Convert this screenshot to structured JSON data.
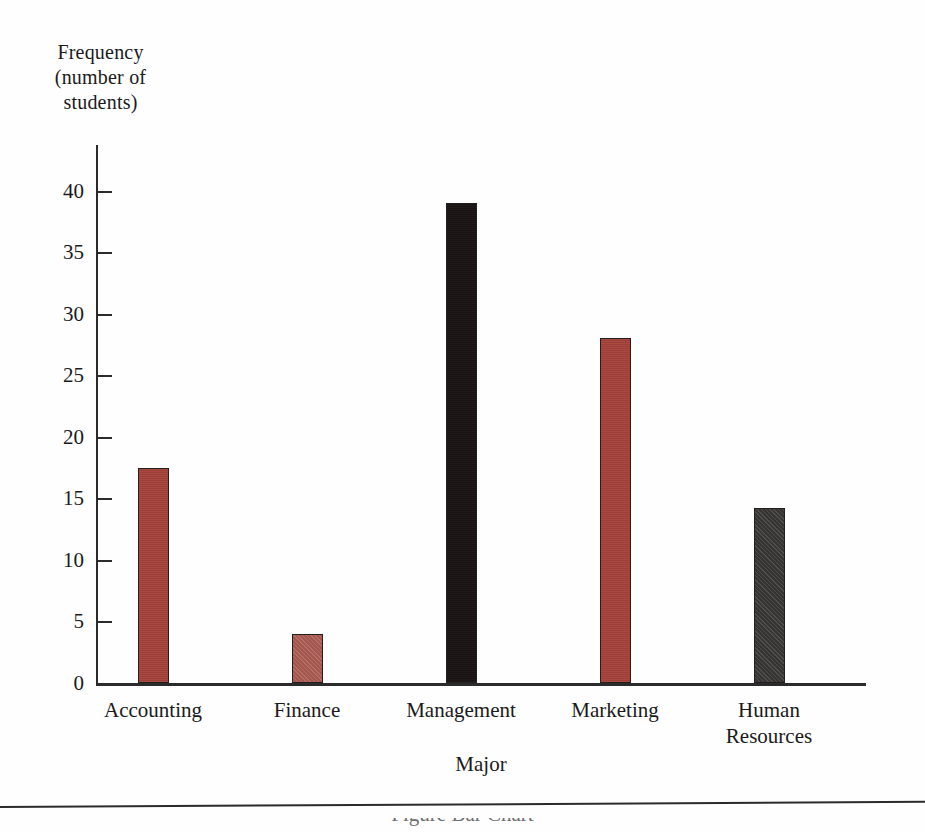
{
  "chart_data": {
    "type": "bar",
    "title": "",
    "xlabel": "Major",
    "ylabel": "Frequency\n(number of\nstudents)",
    "categories": [
      "Accounting",
      "Finance",
      "Management",
      "Marketing",
      "Human\nResources"
    ],
    "values": [
      17.5,
      4,
      39,
      28,
      14.2
    ],
    "bar_colors": [
      "#a4413a",
      "#ab5b51",
      "#191313",
      "#a4413a",
      "#3b3a38"
    ],
    "ylim": [
      0,
      43.7
    ],
    "yticks": [
      0,
      5,
      10,
      15,
      20,
      25,
      30,
      35,
      40
    ],
    "ytick_labels": [
      "0",
      "5",
      "10",
      "15",
      "20",
      "25",
      "30",
      "35",
      "40"
    ],
    "grid": false,
    "legend": null
  },
  "axes": {
    "y_title_line1": "Frequency",
    "y_title_line2": "(number of",
    "y_title_line3": "students)",
    "x_title": "Major"
  },
  "figure": {
    "caption_partial": "Figure  Bar Chart"
  }
}
